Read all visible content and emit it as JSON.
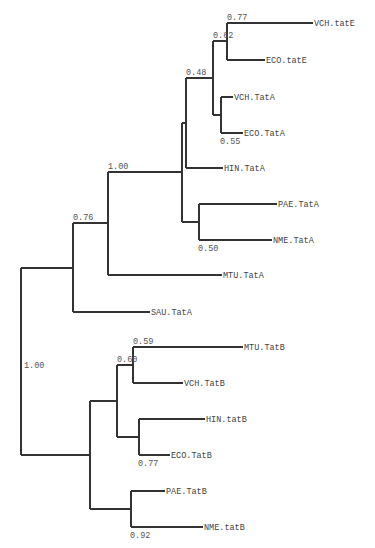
{
  "diagram": {
    "type": "phylogenetic-tree",
    "line_color": "#333333",
    "text_color": "#444444",
    "tips": [
      {
        "id": "vch_tate",
        "label": "VCH.tatE",
        "x": 313,
        "y": 23
      },
      {
        "id": "eco_tate",
        "label": "ECO.tatE",
        "x": 265,
        "y": 60
      },
      {
        "id": "vch_tata",
        "label": "VCH.TatA",
        "x": 233,
        "y": 97
      },
      {
        "id": "eco_tata",
        "label": "ECO.TatA",
        "x": 243,
        "y": 133
      },
      {
        "id": "hin_tata",
        "label": "HIN.TatA",
        "x": 223,
        "y": 168
      },
      {
        "id": "pae_tata",
        "label": "PAE.TatA",
        "x": 277,
        "y": 204
      },
      {
        "id": "nme_tata",
        "label": "NME.TatA",
        "x": 272,
        "y": 240
      },
      {
        "id": "mtu_tata",
        "label": "MTU.TatA",
        "x": 222,
        "y": 275
      },
      {
        "id": "sau_tata",
        "label": "SAU.TatA",
        "x": 150,
        "y": 312
      },
      {
        "id": "mtu_tatb",
        "label": "MTU.TatB",
        "x": 243,
        "y": 347
      },
      {
        "id": "vch_tatb",
        "label": "VCH.TatB",
        "x": 183,
        "y": 383
      },
      {
        "id": "hin_tatb",
        "label": "HIN.tatB",
        "x": 205,
        "y": 419
      },
      {
        "id": "eco_tatb",
        "label": "ECO.TatB",
        "x": 170,
        "y": 455
      },
      {
        "id": "pae_tatb",
        "label": "PAE.TatB",
        "x": 165,
        "y": 491
      },
      {
        "id": "nme_tatb",
        "label": "NME.tatB",
        "x": 203,
        "y": 527
      }
    ],
    "nodes": [
      {
        "id": "n_tate",
        "x": 227,
        "y": 41,
        "children": [
          "vch_tate",
          "eco_tate"
        ],
        "support": "0.77",
        "label_pos": "above"
      },
      {
        "id": "n_tata_ve",
        "x": 221,
        "y": 115,
        "children": [
          "vch_tata",
          "eco_tata"
        ],
        "support": "0.55",
        "label_pos": "below"
      },
      {
        "id": "n_062",
        "x": 213,
        "y": 78,
        "children": [
          "n_tate",
          "n_tata_ve"
        ],
        "support": "0.62",
        "label_pos": "above"
      },
      {
        "id": "n_048",
        "x": 186,
        "y": 123,
        "children": [
          "n_062",
          "hin_tata"
        ],
        "support": "0.48",
        "label_pos": "above"
      },
      {
        "id": "n_050",
        "x": 199,
        "y": 222,
        "children": [
          "pae_tata",
          "nme_tata"
        ],
        "support": "0.50",
        "label_pos": "below"
      },
      {
        "id": "n_inner",
        "x": 182,
        "y": 172,
        "children": [
          "n_048",
          "n_050"
        ],
        "support": "",
        "label_pos": "none"
      },
      {
        "id": "n_100a",
        "x": 108,
        "y": 223,
        "children": [
          "n_inner",
          "mtu_tata"
        ],
        "support": "1.00",
        "label_pos": "above"
      },
      {
        "id": "n_076",
        "x": 73,
        "y": 268,
        "children": [
          "n_100a",
          "sau_tata"
        ],
        "support": "0.76",
        "label_pos": "above"
      },
      {
        "id": "n_059",
        "x": 133,
        "y": 365,
        "children": [
          "mtu_tatb",
          "vch_tatb"
        ],
        "support": "0.59",
        "label_pos": "above"
      },
      {
        "id": "n_077b",
        "x": 139,
        "y": 437,
        "children": [
          "hin_tatb",
          "eco_tatb"
        ],
        "support": "0.77",
        "label_pos": "below"
      },
      {
        "id": "n_060",
        "x": 117,
        "y": 401,
        "children": [
          "n_059",
          "n_077b"
        ],
        "support": "0.60",
        "label_pos": "above"
      },
      {
        "id": "n_092",
        "x": 131,
        "y": 509,
        "children": [
          "pae_tatb",
          "nme_tatb"
        ],
        "support": "0.92",
        "label_pos": "below"
      },
      {
        "id": "n_tatb",
        "x": 90,
        "y": 455,
        "children": [
          "n_060",
          "n_092"
        ],
        "support": "",
        "label_pos": "none"
      },
      {
        "id": "root",
        "x": 21,
        "y": 365,
        "children": [
          "n_076",
          "n_tatb"
        ],
        "support": "1.00",
        "label_pos": "right"
      }
    ]
  }
}
